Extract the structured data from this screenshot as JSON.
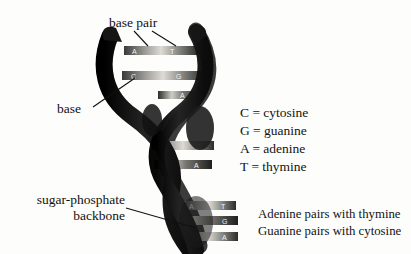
{
  "figure": {
    "background_color": "#fdfdfc",
    "ink_color": "#111111"
  },
  "callouts": {
    "base_pair": "base pair",
    "base": "base",
    "backbone_line1": "sugar-phosphate",
    "backbone_line2": "backbone"
  },
  "legend": {
    "rows": [
      "C = cytosine",
      "G = guanine",
      "A = adenine",
      "T = thymine"
    ]
  },
  "pairing_rules": {
    "rows": [
      "Adenine pairs with thymine",
      "Guanine pairs with cytosine"
    ]
  },
  "helix": {
    "strand_color": "#1b1b1b",
    "rung_light_color": "#d8d8d4",
    "rung_mid_color": "#8e8e8a",
    "rung_dark_color": "#2a2a2a",
    "base_letter_color": "#f2f2ee",
    "rungs": [
      {
        "left": "A",
        "right": "T"
      },
      {
        "left": "C",
        "right": "G"
      },
      {
        "left": "",
        "right": "A"
      },
      {
        "left": "G",
        "right": "C"
      },
      {
        "left": "T",
        "right": "A"
      },
      {
        "left": "A",
        "right": "T"
      },
      {
        "left": "C",
        "right": "G"
      },
      {
        "left": "T",
        "right": "A"
      }
    ]
  }
}
